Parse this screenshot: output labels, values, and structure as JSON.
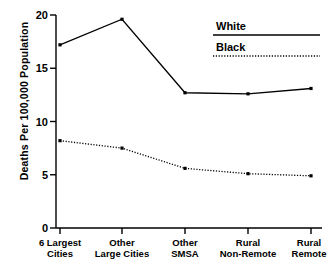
{
  "chart_data": {
    "type": "line",
    "title": "",
    "xlabel": "",
    "ylabel": "Deaths Per 100,000 Population",
    "categories": [
      "6 Largest Cities",
      "Other Large Cities",
      "Other SMSA",
      "Rural Non-Remote",
      "Rural Remote"
    ],
    "category_lines": [
      [
        "6 Largest",
        "Cities"
      ],
      [
        "Other",
        "Large Cities"
      ],
      [
        "Other",
        "SMSA"
      ],
      [
        "Rural",
        "Non-Remote"
      ],
      [
        "Rural",
        "Remote"
      ]
    ],
    "ylim": [
      0,
      20
    ],
    "yticks": [
      0,
      5,
      10,
      15,
      20
    ],
    "ytick_labels": [
      "0",
      "5",
      "10",
      "15",
      "20"
    ],
    "grid": false,
    "legend_position": "top-right",
    "series": [
      {
        "name": "White",
        "style": "solid",
        "color": "#000000",
        "values": [
          17.2,
          19.6,
          12.7,
          12.6,
          13.1
        ]
      },
      {
        "name": "Black",
        "style": "dotted",
        "color": "#000000",
        "values": [
          8.2,
          7.5,
          5.6,
          5.1,
          4.9
        ]
      }
    ]
  },
  "legend": {
    "items": [
      {
        "label": "White",
        "style": "solid"
      },
      {
        "label": "Black",
        "style": "dotted"
      }
    ]
  },
  "axis": {
    "y_title": "Deaths Per 100,000 Population"
  }
}
